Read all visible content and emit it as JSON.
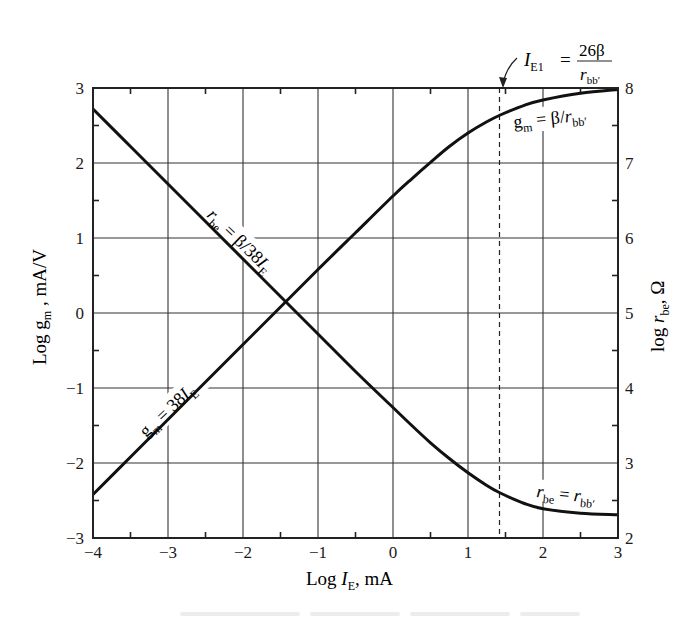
{
  "chart_data": {
    "type": "line",
    "title": "",
    "xlabel": "Log I_E, mA",
    "ylabel": "Log g_m, mA/V",
    "y2label": "log r_be, Ω",
    "xlim": [
      -4,
      3
    ],
    "ylim": [
      -3,
      3
    ],
    "y2lim": [
      2,
      8
    ],
    "grid": true,
    "x_ticks": [
      -4,
      -3,
      -2,
      -1,
      0,
      1,
      2,
      3
    ],
    "x_tick_labels": [
      "−4",
      "−3",
      "−2",
      "−1",
      "0",
      "1",
      "2",
      "3"
    ],
    "y_ticks": [
      -3,
      -2,
      -1,
      0,
      1,
      2,
      3
    ],
    "y_tick_labels": [
      "−3",
      "−2",
      "−1",
      "0",
      "1",
      "2",
      "3"
    ],
    "y2_ticks": [
      2,
      3,
      4,
      5,
      6,
      7,
      8
    ],
    "y2_tick_labels": [
      "2",
      "3",
      "4",
      "5",
      "6",
      "7",
      "8"
    ],
    "params": {
      "beta": 200,
      "r_bb_prime_ohm": 200,
      "gm_per_mA": 38
    },
    "series": [
      {
        "name": "g_m",
        "axis": "left",
        "x": [
          -4,
          -3.5,
          -3,
          -2.5,
          -2,
          -1.5,
          -1,
          -0.5,
          0,
          0.25,
          0.5,
          0.75,
          1,
          1.25,
          1.43,
          1.75,
          2,
          2.5,
          3
        ],
        "y": [
          -2.42,
          -1.92,
          -1.42,
          -0.92,
          -0.42,
          0.08,
          0.58,
          1.07,
          1.56,
          1.79,
          2.01,
          2.22,
          2.4,
          2.55,
          2.64,
          2.77,
          2.84,
          2.93,
          2.98
        ]
      },
      {
        "name": "r_be",
        "axis": "right",
        "x": [
          -4,
          -3.5,
          -3,
          -2.5,
          -2,
          -1.5,
          -1,
          -0.5,
          0,
          0.25,
          0.5,
          0.75,
          1,
          1.25,
          1.43,
          1.75,
          2,
          2.5,
          3
        ],
        "y": [
          7.72,
          7.22,
          6.72,
          6.22,
          5.72,
          5.22,
          4.72,
          4.22,
          3.74,
          3.5,
          3.27,
          3.06,
          2.87,
          2.7,
          2.6,
          2.46,
          2.39,
          2.33,
          2.31
        ]
      }
    ],
    "vertical_marker": {
      "x": 1.42,
      "style": "dashed"
    },
    "annotations": [
      {
        "id": "gm_low",
        "text": "g_m = 38I_E"
      },
      {
        "id": "rbe_low",
        "text": "r_be = β/38I_E"
      },
      {
        "id": "gm_high",
        "text": "g_m = β/r_bb′"
      },
      {
        "id": "rbe_high",
        "text": "r_be = r_bb′"
      },
      {
        "id": "ie1",
        "text": "I_E1 = 26β / r_bb′"
      }
    ],
    "legend": null
  },
  "labels": {
    "xlabel_main": "Log ",
    "xlabel_var": "I",
    "xlabel_sub": "E",
    "xlabel_unit": ", mA",
    "ylabel_main": "Log g",
    "ylabel_sub": "m",
    "ylabel_unit": " , mA/V",
    "y2label_main": "log ",
    "y2label_var": "r",
    "y2label_sub": "be",
    "y2label_unit": ", Ω",
    "gm_low": {
      "a": "g",
      "sub": "m",
      "b": " = 38",
      "var": "I",
      "sub2": "E"
    },
    "rbe_low": {
      "a": "r",
      "sub": "be",
      "b": " = β/38",
      "var": "I",
      "sub2": "E"
    },
    "gm_high": {
      "a": "g",
      "sub": "m",
      "b": "  = β/",
      "var": "r",
      "sub2": "bb′"
    },
    "rbe_high": {
      "a": "r",
      "sub": "be",
      "b": " = ",
      "var": "r",
      "sub2": "bb′"
    },
    "ie1": {
      "var": "I",
      "sub": "E1",
      "eq": "=",
      "num": "26β",
      "den_var": "r",
      "den_sub": "bb′"
    }
  }
}
